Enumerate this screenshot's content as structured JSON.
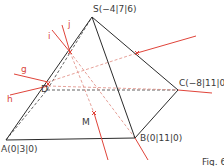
{
  "figure": {
    "caption": "Fig. 6",
    "colors": {
      "edge": "#2b2b2b",
      "hidden_edge": "#3a3a3a",
      "red": "#e0443a",
      "red_dashed": "#e08a80"
    }
  },
  "points": {
    "S": {
      "label": "S(−4|7|6)",
      "x": 92,
      "y": 17
    },
    "A": {
      "label": "A(0|3|0)",
      "x": 6,
      "y": 140
    },
    "B": {
      "label": "B(0|11|0)",
      "x": 135,
      "y": 138
    },
    "C": {
      "label": "C(−8|11|0)",
      "x": 178,
      "y": 90
    },
    "D": {
      "label": "D",
      "x": 47,
      "y": 90
    },
    "M": {
      "label": "M",
      "x": 94,
      "y": 113
    }
  },
  "lines": {
    "g": {
      "label": "g"
    },
    "h": {
      "label": "h"
    },
    "i": {
      "label": "i"
    },
    "j": {
      "label": "j"
    }
  }
}
